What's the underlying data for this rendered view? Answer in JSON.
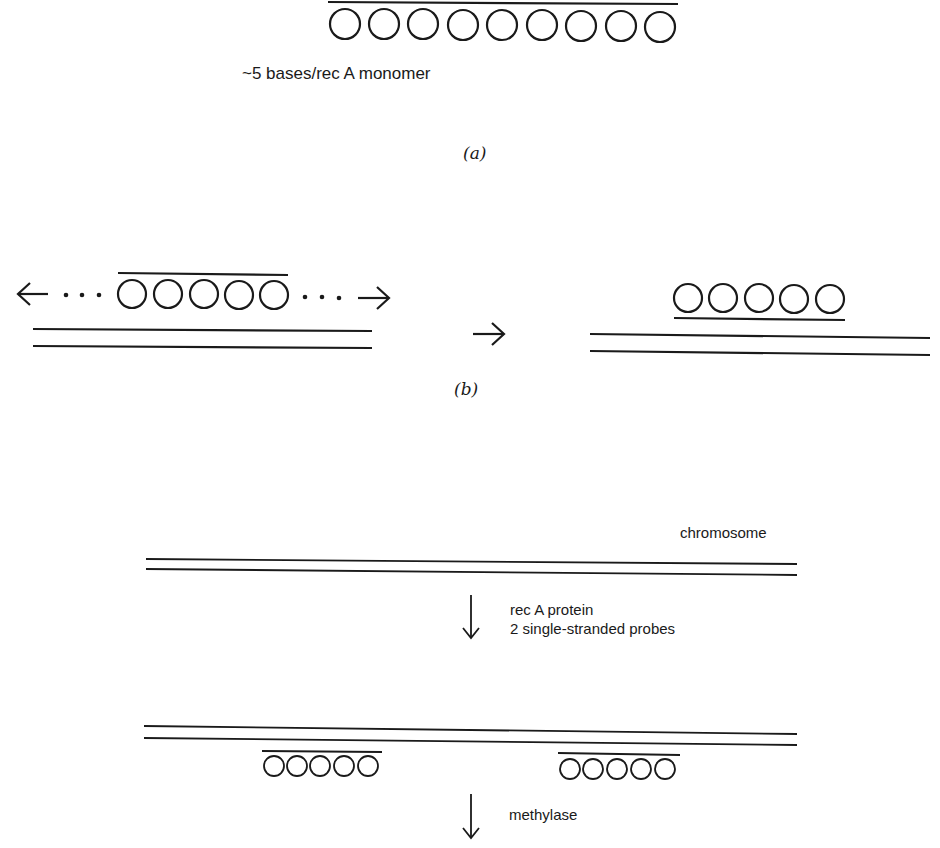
{
  "panel_a": {
    "circle_count": 9,
    "label": "~5 bases/rec A monomer",
    "caption": "(a)"
  },
  "panel_b": {
    "left_circle_count": 5,
    "right_circle_count": 5,
    "left_arrow": "←",
    "right_arrow": "→",
    "ellipsis": "• • •",
    "transition_arrow": "→",
    "caption": "(b)"
  },
  "panel_c": {
    "chromosome_label": "chromosome",
    "step1_label_line1": "rec A protein",
    "step1_label_line2": "2 single-stranded probes",
    "probe_circle_count": 5,
    "step2_label": "methylase",
    "down_arrow": "↓"
  },
  "colors": {
    "ink": "#1a1a1a",
    "background": "#ffffff"
  }
}
